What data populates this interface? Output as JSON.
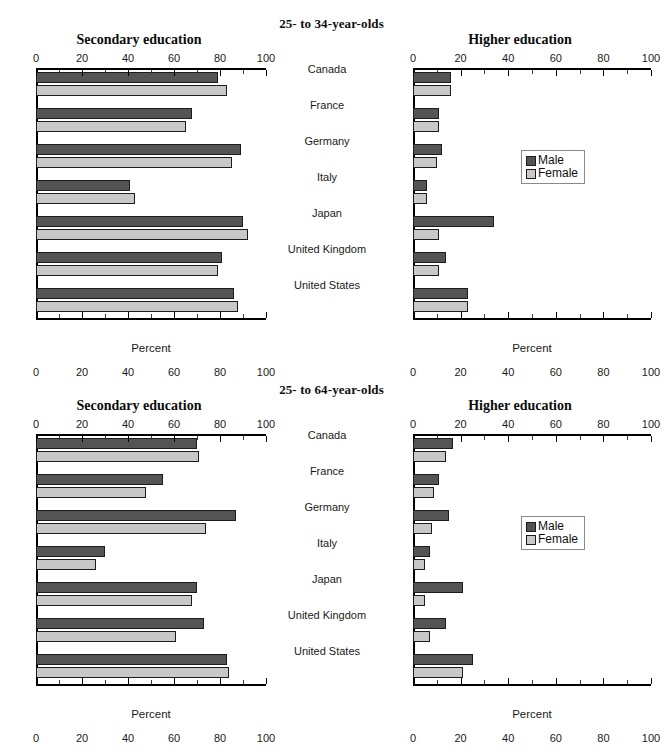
{
  "page": {
    "faint_top_text": ""
  },
  "legend": {
    "male_label": "Male",
    "female_label": "Female",
    "male_color": "#545454",
    "female_color": "#c8c8c8"
  },
  "axis": {
    "caption": "Percent",
    "ticks": [
      0,
      20,
      40,
      60,
      80,
      100
    ],
    "min": 0,
    "max": 100
  },
  "countries": [
    "Canada",
    "France",
    "Germany",
    "Italy",
    "Japan",
    "United Kingdom",
    "United States"
  ],
  "sections": [
    {
      "title": "25- to 34-year-olds"
    },
    {
      "title": "25- to 64-year-olds"
    }
  ],
  "panels": [
    {
      "title": "Secondary education"
    },
    {
      "title": "Higher education"
    },
    {
      "title": "Secondary education"
    },
    {
      "title": "Higher education"
    }
  ],
  "chart_data": [
    {
      "type": "bar",
      "title": "Secondary education",
      "subtitle": "25- to 34-year-olds",
      "orientation": "horizontal",
      "categories": [
        "Canada",
        "France",
        "Germany",
        "Italy",
        "Japan",
        "United Kingdom",
        "United States"
      ],
      "series": [
        {
          "name": "Male",
          "values": [
            79,
            68,
            89,
            41,
            90,
            81,
            86
          ]
        },
        {
          "name": "Female",
          "values": [
            83,
            65,
            85,
            43,
            92,
            79,
            88
          ]
        }
      ],
      "xlabel": "Percent",
      "ylabel": "",
      "xlim": [
        0,
        100
      ],
      "xticks": [
        0,
        20,
        40,
        60,
        80,
        100
      ],
      "grid": false,
      "legend": "none"
    },
    {
      "type": "bar",
      "title": "Higher education",
      "subtitle": "25- to 34-year-olds",
      "orientation": "horizontal",
      "categories": [
        "Canada",
        "France",
        "Germany",
        "Italy",
        "Japan",
        "United Kingdom",
        "United States"
      ],
      "series": [
        {
          "name": "Male",
          "values": [
            16,
            11,
            12,
            6,
            34,
            14,
            23
          ]
        },
        {
          "name": "Female",
          "values": [
            16,
            11,
            10,
            6,
            11,
            11,
            23
          ]
        }
      ],
      "xlabel": "Percent",
      "ylabel": "",
      "xlim": [
        0,
        100
      ],
      "xticks": [
        0,
        20,
        40,
        60,
        80,
        100
      ],
      "grid": false,
      "legend": "inside-right"
    },
    {
      "type": "bar",
      "title": "Secondary education",
      "subtitle": "25- to 64-year-olds",
      "orientation": "horizontal",
      "categories": [
        "Canada",
        "France",
        "Germany",
        "Italy",
        "Japan",
        "United Kingdom",
        "United States"
      ],
      "series": [
        {
          "name": "Male",
          "values": [
            70,
            55,
            87,
            30,
            70,
            73,
            83
          ]
        },
        {
          "name": "Female",
          "values": [
            71,
            48,
            74,
            26,
            68,
            61,
            84
          ]
        }
      ],
      "xlabel": "Percent",
      "ylabel": "",
      "xlim": [
        0,
        100
      ],
      "xticks": [
        0,
        20,
        40,
        60,
        80,
        100
      ],
      "grid": false,
      "legend": "none"
    },
    {
      "type": "bar",
      "title": "Higher education",
      "subtitle": "25- to 64-year-olds",
      "orientation": "horizontal",
      "categories": [
        "Canada",
        "France",
        "Germany",
        "Italy",
        "Japan",
        "United Kingdom",
        "United States"
      ],
      "series": [
        {
          "name": "Male",
          "values": [
            17,
            11,
            15,
            7,
            21,
            14,
            25
          ]
        },
        {
          "name": "Female",
          "values": [
            14,
            9,
            8,
            5,
            5,
            7,
            21
          ]
        }
      ],
      "xlabel": "Percent",
      "ylabel": "",
      "xlim": [
        0,
        100
      ],
      "xticks": [
        0,
        20,
        40,
        60,
        80,
        100
      ],
      "grid": false,
      "legend": "inside-right"
    }
  ]
}
